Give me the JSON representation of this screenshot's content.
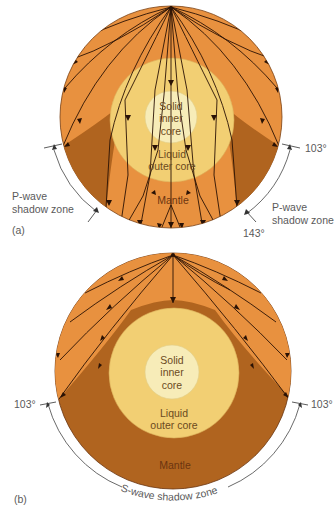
{
  "figure_a": {
    "panel_label": "(a)",
    "inner_core_label": [
      "Solid",
      "inner",
      "core"
    ],
    "outer_core_label": [
      "Liquid",
      "outer core"
    ],
    "mantle_label": "Mantle",
    "left_shadow_label": [
      "P-wave",
      "shadow zone"
    ],
    "right_shadow_label": [
      "P-wave",
      "shadow zone"
    ],
    "angle_103": "103°",
    "angle_143": "143°"
  },
  "figure_b": {
    "panel_label": "(b)",
    "inner_core_label": [
      "Solid",
      "inner",
      "core"
    ],
    "outer_core_label": [
      "Liquid",
      "outer core"
    ],
    "mantle_label": "Mantle",
    "left_angle": "103°",
    "right_angle": "103°",
    "shadow_label": "S-wave shadow zone"
  },
  "colors": {
    "mantle_light": "#e8913f",
    "mantle_dark": "#b0641f",
    "outer_core": "#f2cf73",
    "inner_core": "#f7ecb8",
    "ray": "#2a1205"
  }
}
